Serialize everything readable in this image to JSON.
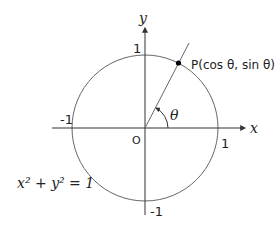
{
  "diagram": {
    "type": "unit-circle",
    "axes": {
      "x_label": "x",
      "y_label": "y",
      "origin_label": "O"
    },
    "ticks": {
      "x_pos": "1",
      "x_neg": "-1",
      "y_pos": "1",
      "y_neg": "-1"
    },
    "point": {
      "label": "P(cos θ, sin θ)"
    },
    "angle_label": "θ",
    "equation": "x² + y² = 1"
  },
  "colors": {
    "stroke": "#555555",
    "text": "#222222",
    "point": "#000000"
  }
}
